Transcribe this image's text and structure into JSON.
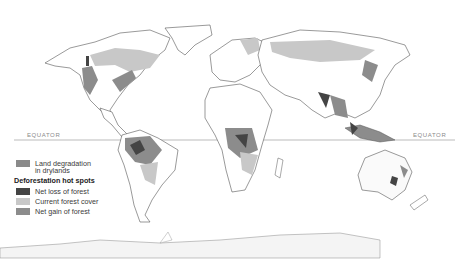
{
  "map": {
    "equator_label_left": "EQUATOR",
    "equator_label_right": "EQUATOR",
    "colors": {
      "land": "#ffffff",
      "border": "#555555",
      "dryland_degradation": "#8a8a8a",
      "net_loss": "#444444",
      "current_forest": "#c8c8c8",
      "net_gain": "#8c8c8c",
      "equator_line": "#aaaaaa",
      "antarctica": "#f4f4f4"
    }
  },
  "legend": {
    "items_top": [
      {
        "label_line1": "Land degradation",
        "label_line2": "in drylands",
        "color": "#8a8a8a"
      }
    ],
    "section_title": "Deforestation hot spots",
    "items": [
      {
        "label": "Net loss of forest",
        "color": "#444444"
      },
      {
        "label": "Current forest cover",
        "color": "#c8c8c8"
      },
      {
        "label": "Net gain of forest",
        "color": "#8c8c8c"
      }
    ]
  }
}
